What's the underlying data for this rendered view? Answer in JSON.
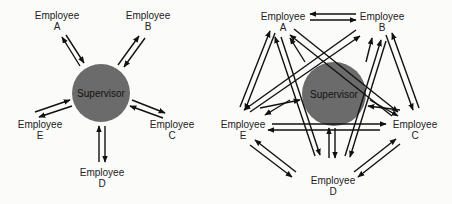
{
  "diagrams": [
    {
      "id": "left",
      "description": "Centralized network: supervisor communicates with each employee",
      "center_label": "Supervisor",
      "nodes": [
        {
          "key": "A",
          "line1": "Employee",
          "line2": "A"
        },
        {
          "key": "B",
          "line1": "Employee",
          "line2": "B"
        },
        {
          "key": "C",
          "line1": "Employee",
          "line2": "C"
        },
        {
          "key": "D",
          "line1": "Employee",
          "line2": "D"
        },
        {
          "key": "E",
          "line1": "Employee",
          "line2": "E"
        }
      ],
      "links": [
        [
          "Supervisor",
          "A"
        ],
        [
          "Supervisor",
          "B"
        ],
        [
          "Supervisor",
          "C"
        ],
        [
          "Supervisor",
          "D"
        ],
        [
          "Supervisor",
          "E"
        ]
      ]
    },
    {
      "id": "right",
      "description": "All-channel network: every employee communicates with every other employee",
      "center_label": "Supervisor",
      "nodes": [
        {
          "key": "A",
          "line1": "Employee",
          "line2": "A"
        },
        {
          "key": "B",
          "line1": "Employee",
          "line2": "B"
        },
        {
          "key": "C",
          "line1": "Employee",
          "line2": "C"
        },
        {
          "key": "D",
          "line1": "Employee",
          "line2": "D"
        },
        {
          "key": "E",
          "line1": "Employee",
          "line2": "E"
        }
      ],
      "links": [
        [
          "A",
          "B"
        ],
        [
          "A",
          "C"
        ],
        [
          "A",
          "D"
        ],
        [
          "A",
          "E"
        ],
        [
          "B",
          "C"
        ],
        [
          "B",
          "D"
        ],
        [
          "B",
          "E"
        ],
        [
          "C",
          "D"
        ],
        [
          "C",
          "E"
        ],
        [
          "D",
          "E"
        ]
      ]
    }
  ],
  "colors": {
    "circle": "#6b6b6b",
    "arrow": "#111111",
    "text": "#222222"
  }
}
